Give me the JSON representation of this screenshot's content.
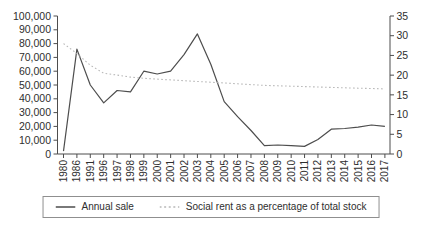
{
  "chart_data": {
    "type": "line",
    "title": "",
    "xlabel": "",
    "ylabel_left": "",
    "ylabel_right": "",
    "grid": false,
    "legend_position": "bottom",
    "categories": [
      "1980",
      "1986",
      "1991",
      "1996",
      "1997",
      "1998",
      "1999",
      "2000",
      "2001",
      "2002",
      "2003",
      "2004",
      "2005",
      "2006",
      "2007",
      "2008",
      "2009",
      "2010",
      "2011",
      "2012",
      "2013",
      "2014",
      "2015",
      "2016",
      "2017"
    ],
    "series": [
      {
        "name": "Annual sale",
        "axis": "left",
        "style": "solid",
        "color": "#4d4d4d",
        "values": [
          2000,
          76000,
          50000,
          37000,
          46000,
          45000,
          60000,
          58000,
          60000,
          72000,
          87000,
          65000,
          38000,
          27000,
          17000,
          6000,
          6500,
          6000,
          5500,
          10500,
          18000,
          18500,
          19500,
          21000,
          20000
        ]
      },
      {
        "name": "Social rent as a percentage of total stock",
        "axis": "right",
        "style": "dotted",
        "color": "#b8b8b8",
        "values": [
          28,
          25.5,
          22.5,
          20.5,
          20,
          19.5,
          19.2,
          19,
          18.8,
          18.6,
          18.4,
          18.2,
          18,
          17.8,
          17.6,
          17.4,
          17.3,
          17.2,
          17.1,
          17,
          16.9,
          16.8,
          16.7,
          16.6,
          16.5
        ]
      }
    ],
    "left_axis": {
      "min": 0,
      "max": 100000,
      "step": 10000,
      "tick_labels": [
        "0",
        "10,000",
        "20,000",
        "30,000",
        "40,000",
        "50,000",
        "60,000",
        "70,000",
        "80,000",
        "90,000",
        "100,000"
      ]
    },
    "right_axis": {
      "min": 0,
      "max": 35,
      "step": 5,
      "tick_labels": [
        "0",
        "5",
        "10",
        "15",
        "20",
        "25",
        "30",
        "35"
      ]
    },
    "colors": {
      "axis": "#4d4d4d",
      "text": "#2e2e2e"
    }
  }
}
